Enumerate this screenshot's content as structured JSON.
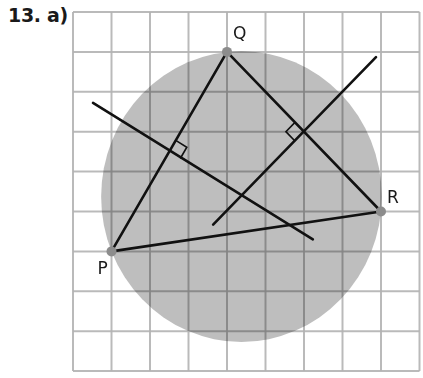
{
  "problem_label": "13. a)",
  "grid": {
    "columns": 9,
    "rows": 9
  },
  "colors": {
    "grid_line": "#b3b3b3",
    "grid_line_on_fill": "#a6a6a6",
    "circle_fill": "#bebebe",
    "segment": "#111111",
    "point": "#8c8c8c",
    "background": "#ffffff"
  },
  "points": [
    {
      "name": "P",
      "col": 1,
      "row": 6
    },
    {
      "name": "Q",
      "col": 4,
      "row": 1
    },
    {
      "name": "R",
      "col": 8,
      "row": 5
    }
  ],
  "triangle_sides": [
    [
      "P",
      "Q"
    ],
    [
      "Q",
      "R"
    ],
    [
      "P",
      "R"
    ]
  ],
  "perpendicular_bisectors": [
    {
      "of": [
        "P",
        "Q"
      ],
      "from": [
        0.52,
        2.28
      ],
      "to": [
        6.23,
        5.7
      ]
    },
    {
      "of": [
        "Q",
        "R"
      ],
      "from": [
        3.64,
        5.33
      ],
      "to": [
        7.87,
        1.13
      ]
    }
  ],
  "circumcircle": {
    "center": [
      4.375,
      4.625
    ],
    "radius": 3.644
  }
}
